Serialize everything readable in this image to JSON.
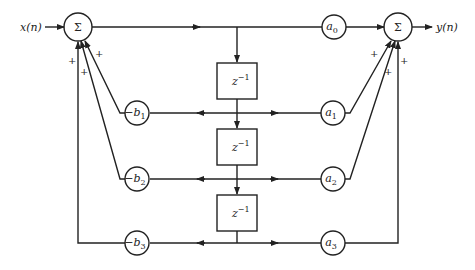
{
  "diagram": {
    "type": "IIR direct form II block diagram (3rd order)",
    "input_label": "x(n)",
    "output_label": "y(n)",
    "summer_symbol": "Σ",
    "delay_label": "z",
    "delay_exp": "−1",
    "plus": "+",
    "feedforward": [
      {
        "label": "a",
        "sub": "0"
      },
      {
        "label": "a",
        "sub": "1"
      },
      {
        "label": "a",
        "sub": "2"
      },
      {
        "label": "a",
        "sub": "3"
      }
    ],
    "feedback": [
      {
        "label": "−b",
        "sub": "1"
      },
      {
        "label": "−b",
        "sub": "2"
      },
      {
        "label": "−b",
        "sub": "3"
      }
    ],
    "colors": {
      "stroke": "#222222",
      "background": "#ffffff"
    }
  }
}
